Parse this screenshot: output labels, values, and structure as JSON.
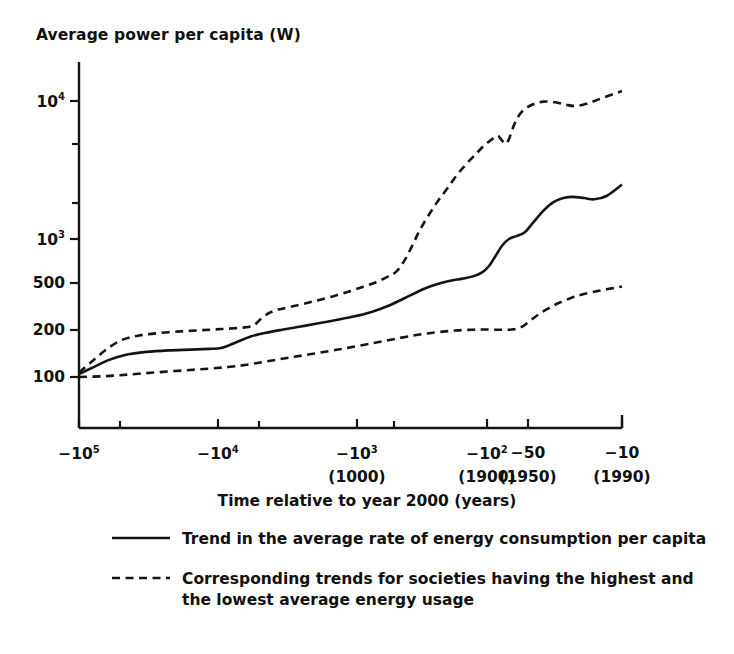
{
  "chart_data": {
    "type": "line",
    "title": "",
    "ylabel": "Average power per capita (W)",
    "xlabel": "Time relative to year 2000 (years)",
    "x_scale": "log-reversed",
    "y_scale": "log",
    "ylim": [
      70,
      16000
    ],
    "xlim": [
      -100000,
      -10
    ],
    "grid": false,
    "legend_position": "below-axes",
    "y_ticks": [
      {
        "value": 10000,
        "label": "10",
        "exp": "4",
        "y_px": 101
      },
      {
        "value": 5000,
        "label": "",
        "exp": "",
        "y_px": 144
      },
      {
        "value": 2000,
        "label": "",
        "exp": "",
        "y_px": 203
      },
      {
        "value": 1000,
        "label": "10",
        "exp": "3",
        "y_px": 239
      },
      {
        "value": 500,
        "label": "500",
        "exp": "",
        "y_px": 283
      },
      {
        "value": 200,
        "label": "200",
        "exp": "",
        "y_px": 330
      },
      {
        "value": 100,
        "label": "100",
        "exp": "",
        "y_px": 377
      }
    ],
    "x_ticks": [
      {
        "value": -100000,
        "label": "−10",
        "exp": "5",
        "sub": "",
        "x_px": 79
      },
      {
        "value": -50000,
        "label": "",
        "exp": "",
        "sub": "",
        "x_px": 120
      },
      {
        "value": -10000,
        "label": "−10",
        "exp": "4",
        "sub": "",
        "x_px": 218
      },
      {
        "value": -5000,
        "label": "",
        "exp": "",
        "sub": "",
        "x_px": 259
      },
      {
        "value": -1000,
        "label": "−10",
        "exp": "3",
        "sub": "(1000)",
        "x_px": 357
      },
      {
        "value": -500,
        "label": "",
        "exp": "",
        "sub": "",
        "x_px": 394
      },
      {
        "value": -100,
        "label": "−10",
        "exp": "2",
        "sub": "(1900)",
        "x_px": 487
      },
      {
        "value": -50,
        "label": "−50",
        "exp": "",
        "sub": "(1950)",
        "x_px": 528
      },
      {
        "value": -10,
        "label": "−10",
        "exp": "",
        "sub": "(1990)",
        "x_px": 622
      }
    ],
    "series": [
      {
        "name": "Trend in the average rate of energy consumption per capita",
        "style": "solid",
        "color": "#141414",
        "points": [
          [
            -100000,
            105
          ],
          [
            -78000,
            118
          ],
          [
            -60000,
            133
          ],
          [
            -45000,
            145
          ],
          [
            -32000,
            152
          ],
          [
            -22000,
            156
          ],
          [
            -15000,
            158
          ],
          [
            -11000,
            160
          ],
          [
            -9000,
            162
          ],
          [
            -7000,
            178
          ],
          [
            -5500,
            196
          ],
          [
            -4200,
            209
          ],
          [
            -3200,
            220
          ],
          [
            -2400,
            231
          ],
          [
            -1800,
            243
          ],
          [
            -1300,
            258
          ],
          [
            -950,
            274
          ],
          [
            -700,
            296
          ],
          [
            -520,
            330
          ],
          [
            -400,
            372
          ],
          [
            -320,
            415
          ],
          [
            -260,
            452
          ],
          [
            -215,
            480
          ],
          [
            -180,
            500
          ],
          [
            -150,
            516
          ],
          [
            -125,
            536
          ],
          [
            -108,
            570
          ],
          [
            -95,
            640
          ],
          [
            -85,
            760
          ],
          [
            -76,
            900
          ],
          [
            -68,
            1000
          ],
          [
            -60,
            1050
          ],
          [
            -52,
            1120
          ],
          [
            -45,
            1320
          ],
          [
            -38,
            1600
          ],
          [
            -32,
            1850
          ],
          [
            -27,
            1980
          ],
          [
            -23,
            2020
          ],
          [
            -19,
            1980
          ],
          [
            -16,
            1940
          ],
          [
            -13,
            2050
          ],
          [
            -10,
            2480
          ]
        ]
      },
      {
        "name": "Highest average energy usage societies",
        "style": "dashed",
        "color": "#141414",
        "points": [
          [
            -100000,
            108
          ],
          [
            -80000,
            130
          ],
          [
            -62000,
            160
          ],
          [
            -48000,
            186
          ],
          [
            -36000,
            200
          ],
          [
            -26000,
            208
          ],
          [
            -18000,
            214
          ],
          [
            -13000,
            218
          ],
          [
            -10000,
            221
          ],
          [
            -8000,
            224
          ],
          [
            -6200,
            228
          ],
          [
            -5200,
            236
          ],
          [
            -4600,
            262
          ],
          [
            -4000,
            290
          ],
          [
            -3400,
            308
          ],
          [
            -2800,
            322
          ],
          [
            -2200,
            340
          ],
          [
            -1700,
            362
          ],
          [
            -1300,
            388
          ],
          [
            -1000,
            420
          ],
          [
            -800,
            452
          ],
          [
            -650,
            486
          ],
          [
            -540,
            530
          ],
          [
            -460,
            580
          ],
          [
            -400,
            700
          ],
          [
            -350,
            900
          ],
          [
            -310,
            1150
          ],
          [
            -270,
            1450
          ],
          [
            -230,
            1850
          ],
          [
            -195,
            2300
          ],
          [
            -165,
            2900
          ],
          [
            -140,
            3500
          ],
          [
            -120,
            4100
          ],
          [
            -105,
            4700
          ],
          [
            -95,
            5100
          ],
          [
            -88,
            5400
          ],
          [
            -82,
            5600
          ],
          [
            -77,
            5200
          ],
          [
            -72,
            4900
          ],
          [
            -68,
            5300
          ],
          [
            -62,
            6800
          ],
          [
            -55,
            8300
          ],
          [
            -46,
            9400
          ],
          [
            -38,
            9900
          ],
          [
            -31,
            9800
          ],
          [
            -26,
            9400
          ],
          [
            -22,
            9200
          ],
          [
            -18,
            9600
          ],
          [
            -14,
            10500
          ],
          [
            -10,
            11800
          ]
        ]
      },
      {
        "name": "Lowest average energy usage societies",
        "style": "dashed",
        "color": "#141414",
        "points": [
          [
            -100000,
            100
          ],
          [
            -70000,
            101
          ],
          [
            -50000,
            103
          ],
          [
            -35000,
            106
          ],
          [
            -24000,
            109
          ],
          [
            -16000,
            112
          ],
          [
            -11000,
            115
          ],
          [
            -8000,
            118
          ],
          [
            -6000,
            122
          ],
          [
            -4500,
            128
          ],
          [
            -3400,
            134
          ],
          [
            -2600,
            140
          ],
          [
            -2000,
            146
          ],
          [
            -1500,
            153
          ],
          [
            -1150,
            160
          ],
          [
            -880,
            168
          ],
          [
            -680,
            176
          ],
          [
            -540,
            184
          ],
          [
            -430,
            192
          ],
          [
            -350,
            199
          ],
          [
            -290,
            205
          ],
          [
            -240,
            210
          ],
          [
            -200,
            214
          ],
          [
            -170,
            217
          ],
          [
            -145,
            219
          ],
          [
            -125,
            220
          ],
          [
            -110,
            221
          ],
          [
            -98,
            221
          ],
          [
            -88,
            220
          ],
          [
            -80,
            220
          ],
          [
            -72,
            220
          ],
          [
            -65,
            221
          ],
          [
            -58,
            225
          ],
          [
            -52,
            238
          ],
          [
            -46,
            262
          ],
          [
            -40,
            290
          ],
          [
            -34,
            318
          ],
          [
            -29,
            345
          ],
          [
            -24,
            372
          ],
          [
            -20,
            395
          ],
          [
            -16,
            415
          ],
          [
            -13,
            432
          ],
          [
            -10,
            452
          ]
        ]
      }
    ],
    "legend": [
      {
        "key": "solid-line-key",
        "text": "Trend in the average rate of energy consumption per capita"
      },
      {
        "key": "dashed-line-key",
        "text": "Corresponding trends for societies having the highest and the lowest average energy usage"
      }
    ]
  }
}
